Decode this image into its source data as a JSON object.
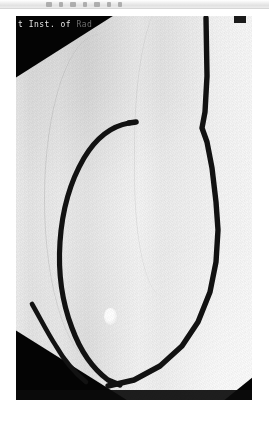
{
  "toolbar": {
    "name": "image-viewer-toolbar",
    "icons": [
      "tool-icon-1",
      "tool-icon-2",
      "tool-icon-3",
      "tool-icon-4",
      "tool-icon-5",
      "tool-icon-6",
      "tool-icon-7"
    ]
  },
  "image": {
    "name": "fluoroscopy-radiograph",
    "modality": "radiograph",
    "overlay_text": "t Inst. of Rad",
    "overlay_text_visible": "t Inst. of",
    "overlay_text_faded": " Rad",
    "overlay_subtext": "",
    "colors": {
      "film_light": "#f6f6f6",
      "film_mid": "#e7e7e7",
      "collimator_black": "#040404",
      "catheter": "#121212",
      "overlay_label": "#e8e8e8",
      "marker_bright": "#ffffff"
    },
    "features": {
      "catheter_loop": "catheter-loop",
      "catheter_vertical": "catheter-vertical-segment",
      "bright_marker": "radiopaque-marker",
      "collimator_corners": [
        "top-left",
        "bottom-left",
        "bottom-right",
        "top-right"
      ]
    }
  }
}
